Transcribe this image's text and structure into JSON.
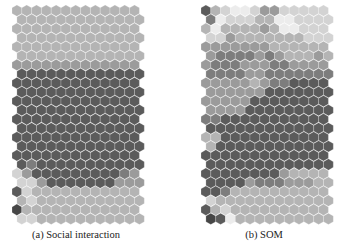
{
  "figure": {
    "palette": {
      "0": "#ececec",
      "1": "#d3d3d3",
      "2": "#b4b4b4",
      "3": "#9b9b9b",
      "4": "#7d7d7d",
      "5": "#5b5b5b",
      "6": "#464646"
    },
    "grid": {
      "cols": 13,
      "rows": 24,
      "hex_w": 9.8,
      "row_h": 9.05
    },
    "panels": [
      {
        "id": "a",
        "caption": "(a) Social interaction",
        "origin_x": 12,
        "origin_y": 5,
        "rows": [
          "2222222222222",
          "2222222222222",
          "2222222222222",
          "2222222222222",
          "2222222222222",
          "2222222222222",
          "3333333333333",
          "5555555555555",
          "5555555555555",
          "5555555555555",
          "5555555555555",
          "5555555555555",
          "5555555555555",
          "5555555555555",
          "5555555555555",
          "5555555555555",
          "5555555555555",
          "5455555555555",
          "1355555555543",
          "1135555555333",
          "5122222222222",
          "2122222222222",
          "6222222222222",
          "1122222222222"
        ]
      },
      {
        "id": "b",
        "caption": "(b) SOM",
        "origin_x": 201,
        "origin_y": 5,
        "rows": [
          "5210013311111",
          "4011122001111",
          "2022223200111",
          "1132222222111",
          "3333333222222",
          "3444434322232",
          "3444333443333",
          "4444334444444",
          "3333323445555",
          "3333335555555",
          "3333355555555",
          "3333555555555",
          "4455555555555",
          "5555555555555",
          "2255555555555",
          "2555555555555",
          "5555555555555",
          "5555555555555",
          "5555555532222",
          "5555344433322",
          "5542222222222",
          "1222222222222",
          "5212222222222",
          "6502222222222"
        ]
      }
    ]
  }
}
